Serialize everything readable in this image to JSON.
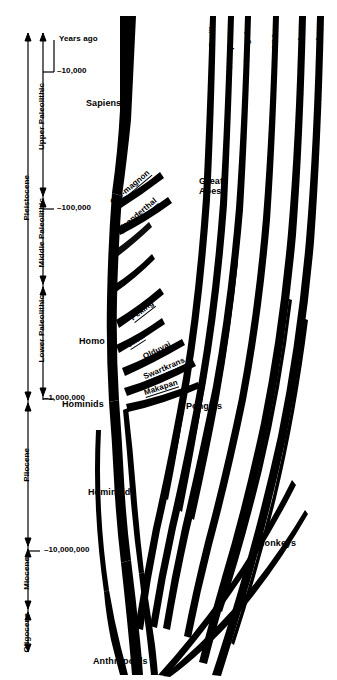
{
  "figure": {
    "kind": "primate-evolution-cladogram",
    "background": "#ffffff",
    "ink": "#000000"
  },
  "axis": {
    "caption": "Years ago",
    "ticks": [
      {
        "label": "–10,000",
        "y": 72
      },
      {
        "label": "–100,000",
        "y": 209
      },
      {
        "label": "–1,000,000",
        "y": 399
      },
      {
        "label": "–10,000,000",
        "y": 551
      }
    ],
    "epochs": [
      {
        "label": "Pleistocene",
        "top": 33,
        "bottom": 400
      },
      {
        "label": "Pliocene",
        "top": 403,
        "bottom": 546
      },
      {
        "label": "Miocene",
        "top": 549,
        "bottom": 609
      },
      {
        "label": "Oligocene",
        "top": 612,
        "bottom": 652
      }
    ],
    "cultures": [
      {
        "label": "Upper Paleolithic",
        "top": 40,
        "bottom": 196
      },
      {
        "label": "Middle Paleolithic",
        "top": 198,
        "bottom": 284
      },
      {
        "label": "Lower Paleolithic",
        "top": 287,
        "bottom": 396
      }
    ]
  },
  "tips": [
    {
      "label": "Gorilla",
      "x": 214,
      "y": 20
    },
    {
      "label": "Chimpanzee",
      "x": 232,
      "y": 20
    },
    {
      "label": "Orangutan",
      "x": 249,
      "y": 20
    },
    {
      "label": "Gibbon",
      "x": 277,
      "y": 20
    },
    {
      "label": "Old world monkeys",
      "x": 303,
      "y": 20
    },
    {
      "label": "New world monkeys",
      "x": 321,
      "y": 20
    }
  ],
  "nodes": [
    {
      "label": "Sapiens",
      "x": 86,
      "y": 103
    },
    {
      "label": "Great Apes",
      "x": 199,
      "y": 182,
      "lines": [
        "Great",
        "Apes"
      ]
    },
    {
      "label": "Homo",
      "x": 79,
      "y": 341
    },
    {
      "label": "Hominids",
      "x": 62,
      "y": 404
    },
    {
      "label": "Pongids",
      "x": 186,
      "y": 406
    },
    {
      "label": "Hominoids",
      "x": 88,
      "y": 492
    },
    {
      "label": "Monkeys",
      "x": 257,
      "y": 543
    },
    {
      "label": "Anthropoids",
      "x": 93,
      "y": 661
    }
  ],
  "fossils": [
    {
      "label": "Cro-magnon",
      "x": 115,
      "y": 197,
      "angle": -40
    },
    {
      "label": "Neanderthal",
      "x": 123,
      "y": 224,
      "angle": -40
    },
    {
      "label": "Peking",
      "x": 135,
      "y": 313,
      "angle": -38
    },
    {
      "label": "Java",
      "x": 131,
      "y": 340,
      "angle": -33
    },
    {
      "label": "Olduvai",
      "x": 146,
      "y": 352,
      "angle": -27
    },
    {
      "label": "Swartkrans",
      "x": 146,
      "y": 372,
      "angle": -23
    },
    {
      "label": "Makapan",
      "x": 146,
      "y": 388,
      "angle": -18
    }
  ]
}
